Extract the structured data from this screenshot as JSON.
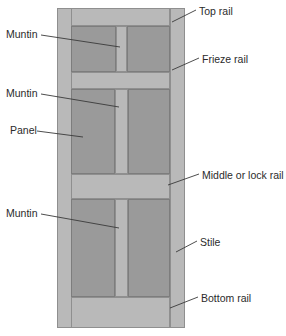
{
  "diagram": {
    "colors": {
      "frame": "#b9b9b9",
      "panel": "#9a9a9a",
      "outline": "#8f8f8f",
      "leader": "#3a3a3a",
      "text": "#2b2b2b",
      "background": "#ffffff"
    },
    "labels": {
      "top_rail": "Top rail",
      "frieze_rail": "Frieze rail",
      "middle_or_lock_rail": "Middle or lock rail",
      "stile": "Stile",
      "bottom_rail": "Bottom rail",
      "muntin_top": "Muntin",
      "muntin_middle": "Muntin",
      "muntin_bottom": "Muntin",
      "panel": "Panel"
    },
    "parts": [
      {
        "name": "Top rail",
        "side": "right"
      },
      {
        "name": "Frieze rail",
        "side": "right"
      },
      {
        "name": "Middle or lock rail",
        "side": "right"
      },
      {
        "name": "Stile",
        "side": "right"
      },
      {
        "name": "Bottom rail",
        "side": "right"
      },
      {
        "name": "Muntin",
        "side": "left"
      },
      {
        "name": "Muntin",
        "side": "left"
      },
      {
        "name": "Panel",
        "side": "left"
      },
      {
        "name": "Muntin",
        "side": "left"
      }
    ]
  }
}
